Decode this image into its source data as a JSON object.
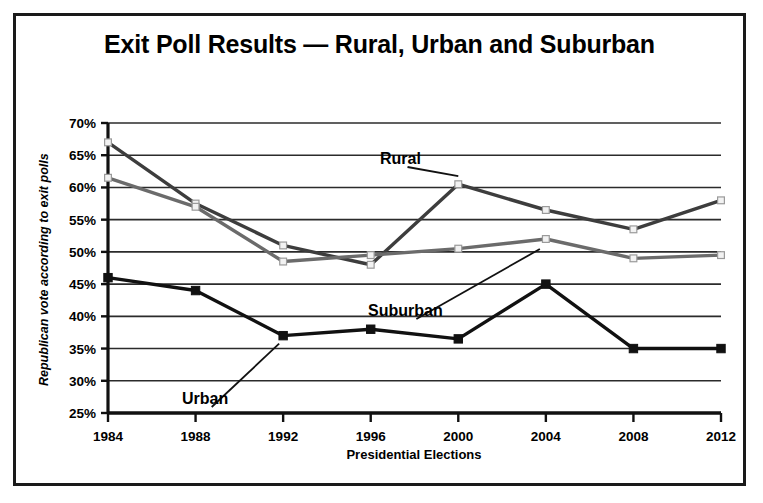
{
  "chart_data": {
    "type": "line",
    "title": "Exit Poll Results — Rural, Urban and Suburban",
    "xlabel": "Presidential Elections",
    "ylabel": "Republican vote according to exit polls",
    "categories": [
      "1984",
      "1988",
      "1992",
      "1996",
      "2000",
      "2004",
      "2008",
      "2012"
    ],
    "ylim": [
      25,
      70
    ],
    "ytick_step": 5,
    "ytick_labels": [
      "25%",
      "30%",
      "35%",
      "40%",
      "45%",
      "50%",
      "55%",
      "60%",
      "65%",
      "70%"
    ],
    "ytick_values": [
      25,
      30,
      35,
      40,
      45,
      50,
      55,
      60,
      65,
      70
    ],
    "grid": "horizontal",
    "legend": "inline-annotations",
    "series": [
      {
        "name": "Rural",
        "color": "#3d3d3d",
        "marker": "open-square",
        "values": [
          67.0,
          57.5,
          51.0,
          48.0,
          60.5,
          56.5,
          53.5,
          58.0
        ]
      },
      {
        "name": "Suburban",
        "color": "#6b6b6b",
        "marker": "open-square",
        "values": [
          61.5,
          57.0,
          48.5,
          49.5,
          50.5,
          52.0,
          49.0,
          49.5
        ]
      },
      {
        "name": "Urban",
        "color": "#111111",
        "marker": "filled-square",
        "values": [
          46.0,
          44.0,
          37.0,
          38.0,
          36.5,
          45.0,
          35.0,
          35.0
        ]
      }
    ],
    "annotations": [
      {
        "text": "Rural",
        "series": "Rural"
      },
      {
        "text": "Suburban",
        "series": "Suburban"
      },
      {
        "text": "Urban",
        "series": "Urban"
      }
    ]
  }
}
